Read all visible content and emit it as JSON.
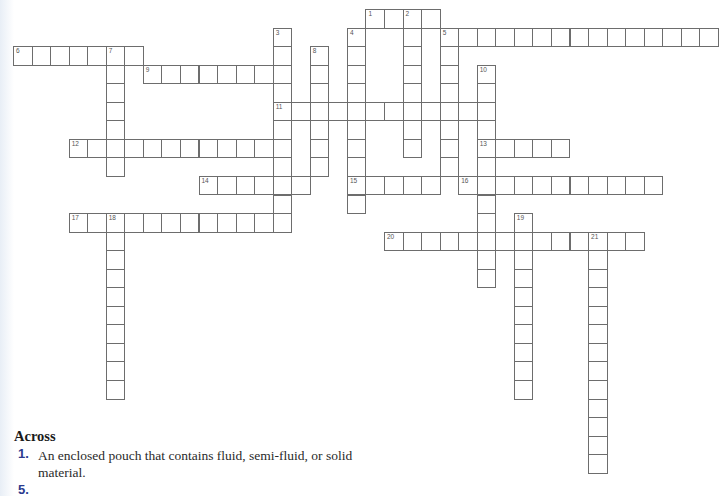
{
  "grid": {
    "origin_x": 13,
    "origin_y": 9,
    "cell_size": 18.55,
    "entries": [
      {
        "number": 1,
        "direction": "across",
        "col": 19,
        "row": 0,
        "length": 4
      },
      {
        "number": 2,
        "direction": "down",
        "col": 21,
        "row": 0,
        "length": 8
      },
      {
        "number": 3,
        "direction": "down",
        "col": 14,
        "row": 1,
        "length": 11
      },
      {
        "number": 4,
        "direction": "down",
        "col": 18,
        "row": 1,
        "length": 10
      },
      {
        "number": 5,
        "direction": "across",
        "col": 23,
        "row": 1,
        "length": 15
      },
      {
        "number": 5,
        "direction": "down",
        "col": 23,
        "row": 1,
        "length": 8
      },
      {
        "number": 6,
        "direction": "across",
        "col": 0,
        "row": 2,
        "length": 7
      },
      {
        "number": 7,
        "direction": "down",
        "col": 5,
        "row": 2,
        "length": 7
      },
      {
        "number": 8,
        "direction": "down",
        "col": 16,
        "row": 2,
        "length": 7
      },
      {
        "number": 9,
        "direction": "across",
        "col": 7,
        "row": 3,
        "length": 8
      },
      {
        "number": 10,
        "direction": "down",
        "col": 25,
        "row": 3,
        "length": 12
      },
      {
        "number": 11,
        "direction": "across",
        "col": 14,
        "row": 5,
        "length": 12
      },
      {
        "number": 12,
        "direction": "across",
        "col": 3,
        "row": 7,
        "length": 12
      },
      {
        "number": 13,
        "direction": "across",
        "col": 25,
        "row": 7,
        "length": 5
      },
      {
        "number": 14,
        "direction": "across",
        "col": 10,
        "row": 9,
        "length": 6
      },
      {
        "number": 15,
        "direction": "across",
        "col": 18,
        "row": 9,
        "length": 5
      },
      {
        "number": 16,
        "direction": "across",
        "col": 24,
        "row": 9,
        "length": 11
      },
      {
        "number": 17,
        "direction": "across",
        "col": 3,
        "row": 11,
        "length": 12
      },
      {
        "number": 18,
        "direction": "down",
        "col": 5,
        "row": 11,
        "length": 10
      },
      {
        "number": 19,
        "direction": "down",
        "col": 27,
        "row": 11,
        "length": 10
      },
      {
        "number": 20,
        "direction": "across",
        "col": 20,
        "row": 12,
        "length": 14
      },
      {
        "number": 21,
        "direction": "down",
        "col": 31,
        "row": 12,
        "length": 13
      }
    ]
  },
  "clues": {
    "across_heading": "Across",
    "items": [
      {
        "number": "1.",
        "text": "An enclosed pouch that contains fluid, semi-fluid, or solid material."
      },
      {
        "number": "5.",
        "text": ""
      }
    ]
  }
}
